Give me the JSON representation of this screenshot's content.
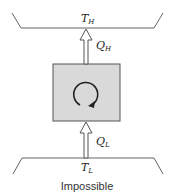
{
  "diagram": {
    "hot_reservoir": {
      "symbol": "T",
      "subscript": "H"
    },
    "cold_reservoir": {
      "symbol": "T",
      "subscript": "L"
    },
    "heat_out": {
      "symbol": "Q",
      "subscript": "H"
    },
    "heat_in": {
      "symbol": "Q",
      "subscript": "L"
    },
    "device": {
      "icon": "cycle-clockwise-icon",
      "fill": "#d9d9d9",
      "border": "#555555"
    },
    "caption": "Impossible"
  }
}
